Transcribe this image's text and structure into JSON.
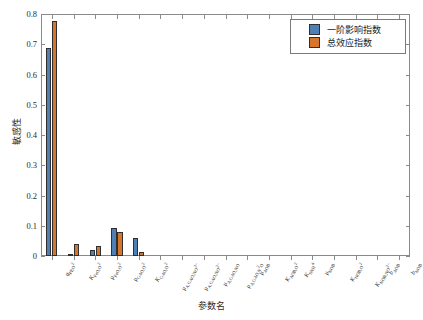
{
  "chart_data": {
    "type": "bar",
    "title": "",
    "xlabel": "参数名",
    "ylabel": "敏感性",
    "ylim": [
      0,
      0.8
    ],
    "yticks": [
      "0",
      "0.1",
      "0.2",
      "0.3",
      "0.4",
      "0.5",
      "0.6",
      "0.7",
      "0.8"
    ],
    "grid": false,
    "legend_position": "top-right",
    "categories": [
      "q_PP,O2",
      "K_FeO,O2",
      "mu_FeO,O2",
      "mu_GAO,O2",
      "K_GAO,O2",
      "mu_A,GAO,NO3-",
      "mu_A,GAO,NO2-",
      "mu_A,GAO,NO",
      "mu_A,GAO,N2O",
      "mu_AOB",
      "K_AOB,O2",
      "K_SNH4",
      "mu_NOB",
      "K_NOB,O2",
      "K_NOB,NO2-",
      "b_AOB",
      "b_NOB"
    ],
    "category_labels_html": [
      "q<sub>PP,O<span class=\"sm\">2</span></sub>",
      "K<sub>FeO,O2</sub>",
      "μ<sub>FeO,O2</sub>",
      "μ<sub>GAO,O2</sub>",
      "K<sub>GAO,O2</sub>",
      "μ<sub>A,GAO,NO3-</sub>",
      "μ<sub>A,GAO,NO2-</sub>",
      "μ<sub>A,GAO,NO</sub>",
      "μ<sub>A,GAO,N2O</sub>",
      "μ<sub>AOB</sub>",
      "K<sub>AOB,O2</sub>",
      "K<sub>SNH4</sub>",
      "μ<sub>NOB</sub>",
      "K<sub>NOB,O2</sub>",
      "K<sub>NOB,NO2-</sub>",
      "b<sub>AOB</sub>",
      "b<sub>NOB</sub>"
    ],
    "series": [
      {
        "name": "一阶影响指数",
        "color": "#4f7fb5",
        "values": [
          0.688,
          0.008,
          0.02,
          0.093,
          0.06,
          0,
          0,
          0,
          0,
          0,
          0,
          0,
          0,
          0,
          0,
          0,
          0
        ]
      },
      {
        "name": "总效应指数",
        "color": "#d4762b",
        "values": [
          0.777,
          0.04,
          0.032,
          0.08,
          0.015,
          0,
          0,
          0,
          0,
          0,
          0,
          0,
          0,
          0,
          0,
          0,
          0
        ]
      }
    ]
  },
  "legend": {
    "items": [
      {
        "label": "一阶影响指数",
        "color": "#4f7fb5"
      },
      {
        "label": "总效应指数",
        "color": "#d4762b"
      }
    ]
  },
  "axes": {
    "y_label": "敏感性",
    "x_label": "参数名",
    "y_ticks": [
      "0.8",
      "0.7",
      "0.6",
      "0.5",
      "0.4",
      "0.3",
      "0.2",
      "0.1",
      "0"
    ]
  },
  "colors": {
    "series1": "#4f7fb5",
    "series2": "#d4762b",
    "axis": "#8a8a8a",
    "text": "#2b2b2b",
    "background": "#ffffff"
  }
}
